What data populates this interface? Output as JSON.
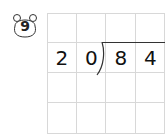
{
  "problem": {
    "number": "9",
    "divisor": [
      "2",
      "0"
    ],
    "dividend": [
      "8",
      "4"
    ]
  },
  "grid": {
    "rows": 4,
    "cols": 4
  }
}
